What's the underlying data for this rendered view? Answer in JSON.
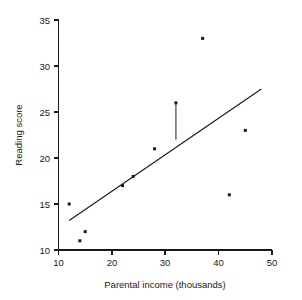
{
  "chart_data": {
    "type": "scatter",
    "title": "",
    "xlabel": "Parental income (thousands)",
    "ylabel": "Reading score",
    "xlim": [
      10,
      50
    ],
    "ylim": [
      10,
      35
    ],
    "xticks": [
      10,
      20,
      30,
      40,
      50
    ],
    "yticks": [
      10,
      15,
      20,
      25,
      30,
      35
    ],
    "xtick_labels": [
      "10",
      "20",
      "30",
      "40",
      "50"
    ],
    "ytick_labels": [
      "10",
      "15",
      "20",
      "25",
      "30",
      "35"
    ],
    "grid": false,
    "legend": "none",
    "x": [
      12,
      14,
      15,
      22,
      24,
      28,
      32,
      37,
      42,
      45
    ],
    "y": [
      15,
      11,
      12,
      17,
      18,
      21,
      26,
      33,
      16,
      23
    ],
    "points": [
      {
        "x": 12,
        "y": 15
      },
      {
        "x": 14,
        "y": 11
      },
      {
        "x": 15,
        "y": 12
      },
      {
        "x": 22,
        "y": 17
      },
      {
        "x": 24,
        "y": 18
      },
      {
        "x": 28,
        "y": 21
      },
      {
        "x": 32,
        "y": 26
      },
      {
        "x": 37,
        "y": 33
      },
      {
        "x": 42,
        "y": 16
      },
      {
        "x": 45,
        "y": 23
      }
    ],
    "series": [
      {
        "name": "observations",
        "type": "scatter",
        "values": [
          15,
          11,
          12,
          17,
          18,
          21,
          26,
          33,
          16,
          23
        ]
      },
      {
        "name": "regression-line",
        "type": "line",
        "x_start": 12,
        "y_start": 13.2,
        "x_end": 48,
        "y_end": 27.5
      }
    ],
    "annotations": [
      {
        "name": "residual-segment",
        "x": 32,
        "y_top": 26,
        "y_bottom": 22
      }
    ]
  },
  "axes": {
    "x_title": "Parental income (thousands)",
    "y_title": "Reading score"
  }
}
